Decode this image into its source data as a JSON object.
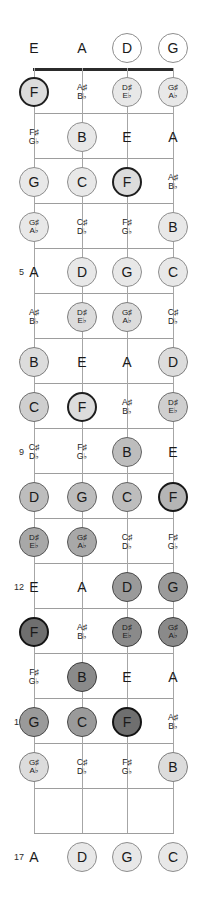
{
  "diagram": {
    "instrument": "4-string bass",
    "tuning": [
      "E",
      "A",
      "D",
      "G"
    ],
    "string_count": 4,
    "fret_count": 17,
    "fret_markers": [
      "5",
      "7",
      "9",
      "12",
      "15",
      "17"
    ],
    "colors": {
      "nut": "#2b2b2b",
      "fret_line": "#9d9d9d",
      "string_line": "#a6a6a6",
      "text": "#1a1a1a",
      "circle_light": "#e8e8e8",
      "circle_mid": "#9a9a9a",
      "circle_dark_outline": "#1e1e1e"
    },
    "string_x": [
      34,
      82,
      127,
      173
    ],
    "nut_y": 68,
    "fret_spacing": 45
  },
  "fret_numbers": [
    {
      "fret": 5,
      "label": "5",
      "y": 272
    },
    {
      "fret": 7,
      "label": "7",
      "y": 362
    },
    {
      "fret": 9,
      "label": "9",
      "y": 452
    },
    {
      "fret": 12,
      "label": "12",
      "y": 587
    },
    {
      "fret": 15,
      "label": "15",
      "y": 722
    },
    {
      "fret": 17,
      "label": "17",
      "y": 857
    }
  ],
  "notes": [
    {
      "fret": 0,
      "string": 0,
      "label": "E",
      "alt": "",
      "style": "plain",
      "y": 48,
      "x": 34
    },
    {
      "fret": 0,
      "string": 1,
      "label": "A",
      "alt": "",
      "style": "plain",
      "y": 48,
      "x": 82
    },
    {
      "fret": 0,
      "string": 2,
      "label": "D",
      "alt": "",
      "style": "c-open",
      "y": 48,
      "x": 127
    },
    {
      "fret": 0,
      "string": 3,
      "label": "G",
      "alt": "",
      "style": "c-open",
      "y": 48,
      "x": 173
    },
    {
      "fret": 1,
      "string": 0,
      "label": "F",
      "alt": "",
      "style": "c-dark",
      "y": 92,
      "x": 34
    },
    {
      "fret": 1,
      "string": 1,
      "label": "A♯",
      "alt": "B♭",
      "style": "plain",
      "y": 92,
      "x": 82
    },
    {
      "fret": 1,
      "string": 2,
      "label": "D♯",
      "alt": "E♭",
      "style": "c-l1",
      "y": 92,
      "x": 127
    },
    {
      "fret": 1,
      "string": 3,
      "label": "G♯",
      "alt": "A♭",
      "style": "c-l1",
      "y": 92,
      "x": 173
    },
    {
      "fret": 2,
      "string": 0,
      "label": "F♯",
      "alt": "G♭",
      "style": "plain",
      "y": 137,
      "x": 34
    },
    {
      "fret": 2,
      "string": 1,
      "label": "B",
      "alt": "",
      "style": "c-l1",
      "y": 137,
      "x": 82
    },
    {
      "fret": 2,
      "string": 2,
      "label": "E",
      "alt": "",
      "style": "plain",
      "y": 137,
      "x": 127
    },
    {
      "fret": 2,
      "string": 3,
      "label": "A",
      "alt": "",
      "style": "plain",
      "y": 137,
      "x": 173
    },
    {
      "fret": 3,
      "string": 0,
      "label": "G",
      "alt": "",
      "style": "c-l1",
      "y": 182,
      "x": 34
    },
    {
      "fret": 3,
      "string": 1,
      "label": "C",
      "alt": "",
      "style": "c-l1",
      "y": 182,
      "x": 82
    },
    {
      "fret": 3,
      "string": 2,
      "label": "F",
      "alt": "",
      "style": "c-dark",
      "y": 182,
      "x": 127
    },
    {
      "fret": 3,
      "string": 3,
      "label": "A♯",
      "alt": "B♭",
      "style": "plain",
      "y": 182,
      "x": 173
    },
    {
      "fret": 4,
      "string": 0,
      "label": "G♯",
      "alt": "A♭",
      "style": "c-l1",
      "y": 227,
      "x": 34
    },
    {
      "fret": 4,
      "string": 1,
      "label": "C♯",
      "alt": "D♭",
      "style": "plain",
      "y": 227,
      "x": 82
    },
    {
      "fret": 4,
      "string": 2,
      "label": "F♯",
      "alt": "G♭",
      "style": "plain",
      "y": 227,
      "x": 127
    },
    {
      "fret": 4,
      "string": 3,
      "label": "B",
      "alt": "",
      "style": "c-l1",
      "y": 227,
      "x": 173
    },
    {
      "fret": 5,
      "string": 0,
      "label": "A",
      "alt": "",
      "style": "plain",
      "y": 272,
      "x": 34
    },
    {
      "fret": 5,
      "string": 1,
      "label": "D",
      "alt": "",
      "style": "c-l1",
      "y": 272,
      "x": 82
    },
    {
      "fret": 5,
      "string": 2,
      "label": "G",
      "alt": "",
      "style": "c-l1",
      "y": 272,
      "x": 127
    },
    {
      "fret": 5,
      "string": 3,
      "label": "C",
      "alt": "",
      "style": "c-l1",
      "y": 272,
      "x": 173
    },
    {
      "fret": 6,
      "string": 0,
      "label": "A♯",
      "alt": "B♭",
      "style": "plain",
      "y": 317,
      "x": 34
    },
    {
      "fret": 6,
      "string": 1,
      "label": "D♯",
      "alt": "E♭",
      "style": "c-l2",
      "y": 317,
      "x": 82
    },
    {
      "fret": 6,
      "string": 2,
      "label": "G♯",
      "alt": "A♭",
      "style": "c-l2",
      "y": 317,
      "x": 127
    },
    {
      "fret": 6,
      "string": 3,
      "label": "C♯",
      "alt": "D♭",
      "style": "plain",
      "y": 317,
      "x": 173
    },
    {
      "fret": 7,
      "string": 0,
      "label": "B",
      "alt": "",
      "style": "c-l2",
      "y": 362,
      "x": 34
    },
    {
      "fret": 7,
      "string": 1,
      "label": "E",
      "alt": "",
      "style": "plain",
      "y": 362,
      "x": 82
    },
    {
      "fret": 7,
      "string": 2,
      "label": "A",
      "alt": "",
      "style": "plain",
      "y": 362,
      "x": 127
    },
    {
      "fret": 7,
      "string": 3,
      "label": "D",
      "alt": "",
      "style": "c-l2",
      "y": 362,
      "x": 173
    },
    {
      "fret": 8,
      "string": 0,
      "label": "C",
      "alt": "",
      "style": "c-l3",
      "y": 407,
      "x": 34
    },
    {
      "fret": 8,
      "string": 1,
      "label": "F",
      "alt": "",
      "style": "c-dark",
      "y": 407,
      "x": 82
    },
    {
      "fret": 8,
      "string": 2,
      "label": "A♯",
      "alt": "B♭",
      "style": "plain",
      "y": 407,
      "x": 127
    },
    {
      "fret": 8,
      "string": 3,
      "label": "D♯",
      "alt": "E♭",
      "style": "c-l3",
      "y": 407,
      "x": 173
    },
    {
      "fret": 9,
      "string": 0,
      "label": "C♯",
      "alt": "D♭",
      "style": "plain",
      "y": 452,
      "x": 34
    },
    {
      "fret": 9,
      "string": 1,
      "label": "F♯",
      "alt": "G♭",
      "style": "plain",
      "y": 452,
      "x": 82
    },
    {
      "fret": 9,
      "string": 2,
      "label": "B",
      "alt": "",
      "style": "c-m1",
      "y": 452,
      "x": 127
    },
    {
      "fret": 9,
      "string": 3,
      "label": "E",
      "alt": "",
      "style": "plain",
      "y": 452,
      "x": 173
    },
    {
      "fret": 10,
      "string": 0,
      "label": "D",
      "alt": "",
      "style": "c-m1",
      "y": 497,
      "x": 34
    },
    {
      "fret": 10,
      "string": 1,
      "label": "G",
      "alt": "",
      "style": "c-m1",
      "y": 497,
      "x": 82
    },
    {
      "fret": 10,
      "string": 2,
      "label": "C",
      "alt": "",
      "style": "c-m1",
      "y": 497,
      "x": 127
    },
    {
      "fret": 10,
      "string": 3,
      "label": "F",
      "alt": "",
      "style": "c-dark2",
      "y": 497,
      "x": 173
    },
    {
      "fret": 11,
      "string": 0,
      "label": "D♯",
      "alt": "E♭",
      "style": "c-m2",
      "y": 542,
      "x": 34
    },
    {
      "fret": 11,
      "string": 1,
      "label": "G♯",
      "alt": "A♭",
      "style": "c-m2",
      "y": 542,
      "x": 82
    },
    {
      "fret": 11,
      "string": 2,
      "label": "C♯",
      "alt": "D♭",
      "style": "plain",
      "y": 542,
      "x": 127
    },
    {
      "fret": 11,
      "string": 3,
      "label": "F♯",
      "alt": "G♭",
      "style": "plain",
      "y": 542,
      "x": 173
    },
    {
      "fret": 12,
      "string": 0,
      "label": "E",
      "alt": "",
      "style": "plain",
      "y": 587,
      "x": 34
    },
    {
      "fret": 12,
      "string": 1,
      "label": "A",
      "alt": "",
      "style": "plain",
      "y": 587,
      "x": 82
    },
    {
      "fret": 12,
      "string": 2,
      "label": "D",
      "alt": "",
      "style": "c-m3",
      "y": 587,
      "x": 127
    },
    {
      "fret": 12,
      "string": 3,
      "label": "G",
      "alt": "",
      "style": "c-m3",
      "y": 587,
      "x": 173
    },
    {
      "fret": 13,
      "string": 0,
      "label": "F",
      "alt": "",
      "style": "c-dark3",
      "y": 632,
      "x": 34
    },
    {
      "fret": 13,
      "string": 1,
      "label": "A♯",
      "alt": "B♭",
      "style": "plain",
      "y": 632,
      "x": 82
    },
    {
      "fret": 13,
      "string": 2,
      "label": "D♯",
      "alt": "E♭",
      "style": "c-d1",
      "y": 632,
      "x": 127
    },
    {
      "fret": 13,
      "string": 3,
      "label": "G♯",
      "alt": "A♭",
      "style": "c-d1",
      "y": 632,
      "x": 173
    },
    {
      "fret": 14,
      "string": 0,
      "label": "F♯",
      "alt": "G♭",
      "style": "plain",
      "y": 677,
      "x": 34
    },
    {
      "fret": 14,
      "string": 1,
      "label": "B",
      "alt": "",
      "style": "c-d1",
      "y": 677,
      "x": 82
    },
    {
      "fret": 14,
      "string": 2,
      "label": "E",
      "alt": "",
      "style": "plain",
      "y": 677,
      "x": 127
    },
    {
      "fret": 14,
      "string": 3,
      "label": "A",
      "alt": "",
      "style": "plain",
      "y": 677,
      "x": 173
    },
    {
      "fret": 15,
      "string": 0,
      "label": "G",
      "alt": "",
      "style": "c-m3",
      "y": 722,
      "x": 34
    },
    {
      "fret": 15,
      "string": 1,
      "label": "C",
      "alt": "",
      "style": "c-m3",
      "y": 722,
      "x": 82
    },
    {
      "fret": 15,
      "string": 2,
      "label": "F",
      "alt": "",
      "style": "c-dark3",
      "y": 722,
      "x": 127
    },
    {
      "fret": 15,
      "string": 3,
      "label": "A♯",
      "alt": "B♭",
      "style": "plain",
      "y": 722,
      "x": 173
    },
    {
      "fret": 16,
      "string": 0,
      "label": "G♯",
      "alt": "A♭",
      "style": "c-l2",
      "y": 767,
      "x": 34
    },
    {
      "fret": 16,
      "string": 1,
      "label": "C♯",
      "alt": "D♭",
      "style": "plain",
      "y": 767,
      "x": 82
    },
    {
      "fret": 16,
      "string": 2,
      "label": "F♯",
      "alt": "G♭",
      "style": "plain",
      "y": 767,
      "x": 127
    },
    {
      "fret": 16,
      "string": 3,
      "label": "B",
      "alt": "",
      "style": "c-l2",
      "y": 767,
      "x": 173
    },
    {
      "fret": 17,
      "string": 0,
      "label": "A",
      "alt": "",
      "style": "plain",
      "y": 857,
      "x": 34
    },
    {
      "fret": 17,
      "string": 1,
      "label": "D",
      "alt": "",
      "style": "c-l1",
      "y": 857,
      "x": 82
    },
    {
      "fret": 17,
      "string": 2,
      "label": "G",
      "alt": "",
      "style": "c-l1",
      "y": 857,
      "x": 127
    },
    {
      "fret": 17,
      "string": 3,
      "label": "C",
      "alt": "",
      "style": "c-l1",
      "y": 857,
      "x": 173
    }
  ]
}
